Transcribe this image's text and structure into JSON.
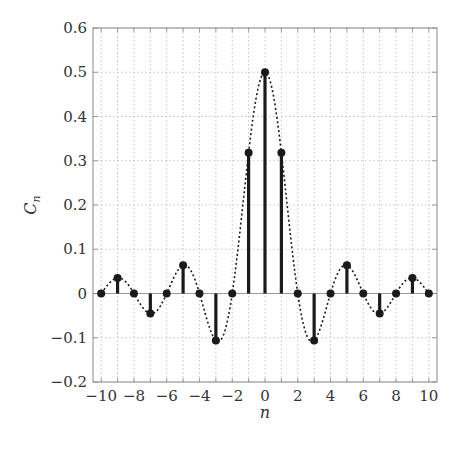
{
  "chart_data": {
    "type": "stem",
    "title": "",
    "xlabel": "n",
    "ylabel": "C_n",
    "xlim": [
      -10.5,
      10.5
    ],
    "ylim": [
      -0.2,
      0.6
    ],
    "grid": true,
    "legend": null,
    "x_ticks": [
      -10,
      -8,
      -6,
      -4,
      -2,
      0,
      2,
      4,
      6,
      8,
      10
    ],
    "x_tick_labels": [
      "−10",
      "−8",
      "−6",
      "−4",
      "−2",
      "0",
      "2",
      "4",
      "6",
      "8",
      "10"
    ],
    "y_ticks": [
      -0.2,
      -0.1,
      0,
      0.1,
      0.2,
      0.3,
      0.4,
      0.5,
      0.6
    ],
    "y_tick_labels": [
      "−0.2",
      "−0.1",
      "0",
      "0.1",
      "0.2",
      "0.3",
      "0.4",
      "0.5",
      "0.6"
    ],
    "series": [
      {
        "name": "C_n",
        "style": "stem",
        "x": [
          -10,
          -9,
          -8,
          -7,
          -6,
          -5,
          -4,
          -3,
          -2,
          -1,
          0,
          1,
          2,
          3,
          4,
          5,
          6,
          7,
          8,
          9,
          10
        ],
        "values": [
          0,
          0.035,
          0,
          -0.045,
          0,
          0.064,
          0,
          -0.106,
          0,
          0.318,
          0.5,
          0.318,
          0,
          -0.106,
          0,
          0.064,
          0,
          -0.045,
          0,
          0.035,
          0
        ]
      },
      {
        "name": "envelope",
        "style": "dotted-line",
        "function": "0.5*sinc(x/2)"
      }
    ]
  },
  "colors": {
    "stem": "#1a1a1a",
    "grid": "#b8b8b8",
    "frame": "#888888",
    "text": "#333333"
  }
}
